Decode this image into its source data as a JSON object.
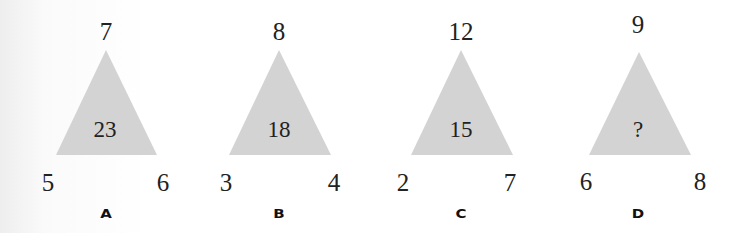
{
  "puzzles": [
    {
      "label": "A",
      "top": "7",
      "left": "5",
      "right": "6",
      "center": "23"
    },
    {
      "label": "B",
      "top": "8",
      "left": "3",
      "right": "4",
      "center": "18"
    },
    {
      "label": "C",
      "top": "12",
      "left": "2",
      "right": "7",
      "center": "15"
    },
    {
      "label": "D",
      "top": "9",
      "left": "6",
      "right": "8",
      "center": "?"
    }
  ],
  "colors": {
    "triangle_fill": "#d3d3d3",
    "text": "#222222"
  }
}
